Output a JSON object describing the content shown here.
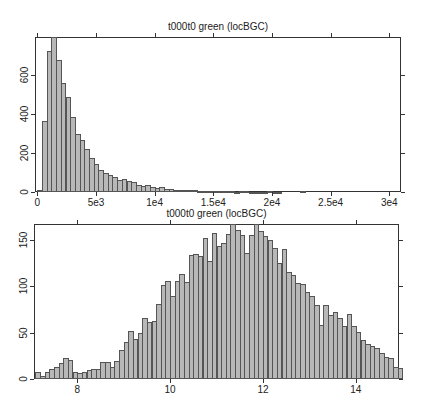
{
  "chart_data": [
    {
      "type": "bar",
      "title": "t000t0 green  (locBGC)",
      "xlabel": "",
      "ylabel": "",
      "xlim": [
        -200,
        31000
      ],
      "ylim": [
        0,
        795
      ],
      "grid": false,
      "x_ticks": [
        0,
        5000,
        10000,
        15000,
        20000,
        25000,
        30000
      ],
      "x_tick_labels": [
        "0",
        "5e3",
        "1e4",
        "1.5e4",
        "2e4",
        "2.5e4",
        "3e4"
      ],
      "y_ticks": [
        0,
        200,
        400,
        600
      ],
      "y_tick_labels": [
        "0",
        "200",
        "400",
        "600"
      ],
      "bin_width": 400,
      "bin_starts": [
        0,
        400,
        800,
        1200,
        1600,
        2000,
        2400,
        2800,
        3200,
        3600,
        4000,
        4400,
        4800,
        5200,
        5600,
        6000,
        6400,
        6800,
        7200,
        7600,
        8000,
        8400,
        8800,
        9200,
        9600,
        10000,
        10400,
        10800,
        11200,
        11600,
        12000,
        12400,
        12800,
        13200,
        13600,
        14000,
        14400,
        14800,
        15200,
        15600,
        16000,
        16400,
        16800,
        17200,
        17600,
        18000,
        18400,
        18800,
        19200,
        19600,
        20000,
        20400,
        22400
      ],
      "values": [
        10,
        365,
        725,
        795,
        675,
        560,
        490,
        385,
        300,
        265,
        220,
        175,
        145,
        115,
        100,
        90,
        75,
        60,
        65,
        55,
        50,
        38,
        30,
        35,
        25,
        22,
        24,
        15,
        14,
        12,
        10,
        10,
        8,
        10,
        6,
        5,
        6,
        4,
        5,
        4,
        3,
        3,
        2,
        4,
        3,
        2,
        2,
        2,
        2,
        3,
        2,
        2,
        3
      ]
    },
    {
      "type": "bar",
      "title": "t000t0 green  (locBGC)",
      "xlabel": "",
      "ylabel": "",
      "xlim": [
        7.07,
        14.93
      ],
      "ylim": [
        0,
        167
      ],
      "grid": false,
      "x_ticks": [
        8,
        10,
        12,
        14
      ],
      "x_tick_labels": [
        "8",
        "10",
        "12",
        "14"
      ],
      "y_ticks": [
        0,
        50,
        100,
        150
      ],
      "y_tick_labels": [
        "0",
        "50",
        "100",
        "150"
      ],
      "bin_width": 0.1,
      "bin_starts": [
        7.1,
        7.2,
        7.3,
        7.4,
        7.5,
        7.6,
        7.7,
        7.8,
        7.9,
        8.0,
        8.1,
        8.2,
        8.3,
        8.4,
        8.5,
        8.6,
        8.7,
        8.8,
        8.9,
        9.0,
        9.1,
        9.2,
        9.3,
        9.4,
        9.5,
        9.6,
        9.7,
        9.8,
        9.9,
        10.0,
        10.1,
        10.2,
        10.3,
        10.4,
        10.5,
        10.6,
        10.7,
        10.8,
        10.9,
        11.0,
        11.1,
        11.2,
        11.3,
        11.4,
        11.5,
        11.6,
        11.7,
        11.8,
        11.9,
        12.0,
        12.1,
        12.2,
        12.3,
        12.4,
        12.5,
        12.6,
        12.7,
        12.8,
        12.9,
        13.0,
        13.1,
        13.2,
        13.3,
        13.4,
        13.5,
        13.6,
        13.7,
        13.8,
        13.9,
        14.0,
        14.1,
        14.2,
        14.3,
        14.4,
        14.5,
        14.6,
        14.7,
        14.8,
        14.9
      ],
      "values": [
        8,
        3,
        8,
        11,
        13,
        17,
        23,
        21,
        8,
        7,
        8,
        10,
        11,
        11,
        18,
        18,
        13,
        19,
        31,
        40,
        52,
        43,
        50,
        66,
        62,
        63,
        81,
        101,
        106,
        89,
        106,
        113,
        105,
        134,
        135,
        133,
        152,
        127,
        157,
        143,
        147,
        156,
        168,
        161,
        155,
        136,
        155,
        168,
        160,
        154,
        150,
        141,
        125,
        140,
        115,
        112,
        103,
        102,
        94,
        90,
        80,
        58,
        80,
        69,
        72,
        66,
        57,
        70,
        57,
        51,
        42,
        38,
        36,
        33,
        28,
        24,
        23,
        13,
        12,
        10,
        7,
        6,
        7,
        6,
        3,
        6,
        2,
        1,
        0,
        1
      ]
    }
  ],
  "plots": [
    {
      "title": "t000t0 green  (locBGC)"
    },
    {
      "title": "t000t0 green  (locBGC)"
    }
  ]
}
